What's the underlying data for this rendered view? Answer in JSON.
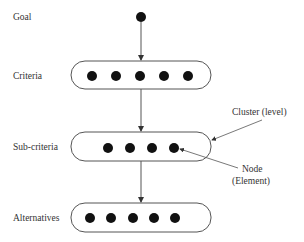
{
  "diagram": {
    "levels": [
      {
        "label": "Goal",
        "node_count": 1
      },
      {
        "label": "Criteria",
        "node_count": 5
      },
      {
        "label": "Sub-criteria",
        "node_count": 4
      },
      {
        "label": "Alternatives",
        "node_count": 5
      }
    ],
    "annotations": {
      "cluster": "Cluster (level)",
      "node_line1": "Node",
      "node_line2": "(Element)"
    },
    "colors": {
      "node": "#111111",
      "line": "#555555",
      "text": "#333333"
    }
  }
}
